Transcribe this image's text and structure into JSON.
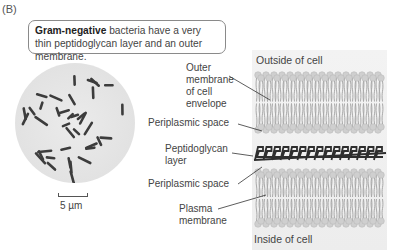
{
  "panel": {
    "label": "(B)"
  },
  "caption": {
    "bold": "Gram-negative",
    "rest": " bacteria have a very thin peptidoglycan layer and an outer membrane."
  },
  "micrograph": {
    "scale_label": "5 µm",
    "description": "Light micrograph of rod-shaped Gram-negative bacteria"
  },
  "diagram": {
    "outside_label": "Outside of cell",
    "inside_label": "Inside of cell",
    "labels": [
      {
        "id": "outer-membrane",
        "lines": [
          "Outer",
          "membrane",
          "of cell",
          "envelope"
        ]
      },
      {
        "id": "periplasmic-space-top",
        "lines": [
          "Periplasmic space"
        ]
      },
      {
        "id": "peptidoglycan-layer",
        "lines": [
          "Peptidoglycan",
          "layer"
        ]
      },
      {
        "id": "periplasmic-space-bottom",
        "lines": [
          "Periplasmic space"
        ]
      },
      {
        "id": "plasma-membrane",
        "lines": [
          "Plasma",
          "membrane"
        ]
      }
    ]
  },
  "colors": {
    "lipid_head": "#cfcfcf",
    "lipid_tail": "#a9a9a9",
    "peptidoglycan": "#2e2e2e",
    "bacteria": "#3c3c3c",
    "leader_line": "#333333"
  }
}
